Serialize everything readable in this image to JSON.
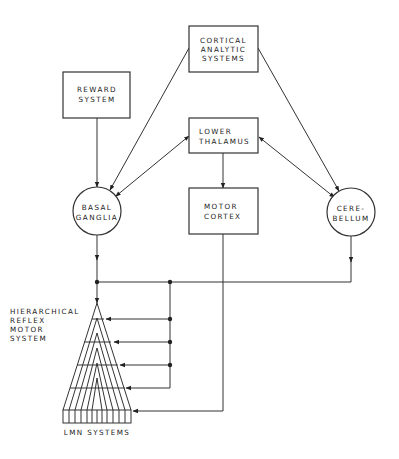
{
  "diagram": {
    "nodes": {
      "cortical": {
        "lines": [
          "CORTICAL",
          "ANALYTIC",
          "SYSTEMS"
        ],
        "shape": "box"
      },
      "reward": {
        "lines": [
          "REWARD",
          "SYSTEM"
        ],
        "shape": "box"
      },
      "thalamus": {
        "lines": [
          "LOWER",
          "THALAMUS"
        ],
        "shape": "box"
      },
      "motor_cortex": {
        "lines": [
          "MOTOR",
          "CORTEX"
        ],
        "shape": "box"
      },
      "basal_ganglia": {
        "lines": [
          "BASAL",
          "GANGLIA"
        ],
        "shape": "circle"
      },
      "cerebellum": {
        "lines": [
          "CERE-",
          "BELLUM"
        ],
        "shape": "circle"
      },
      "hierarchical": {
        "lines": [
          "HIERARCHICAL",
          "REFLEX",
          "MOTOR",
          "SYSTEM"
        ],
        "shape": "label"
      },
      "lmn": {
        "lines": [
          "LMN SYSTEMS"
        ],
        "shape": "label"
      }
    },
    "edges": [
      {
        "from": "cortical",
        "to": "basal_ganglia"
      },
      {
        "from": "cortical",
        "to": "cerebellum"
      },
      {
        "from": "reward",
        "to": "basal_ganglia"
      },
      {
        "from": "basal_ganglia",
        "to": "thalamus",
        "bidirectional": true
      },
      {
        "from": "cerebellum",
        "to": "thalamus",
        "bidirectional": true
      },
      {
        "from": "thalamus",
        "to": "motor_cortex"
      },
      {
        "from": "basal_ganglia",
        "to": "hierarchical"
      },
      {
        "from": "cerebellum",
        "to": "hierarchical"
      },
      {
        "from": "motor_cortex",
        "to": "lmn"
      }
    ],
    "colors": {
      "line": "#333333",
      "background": "#ffffff"
    }
  }
}
